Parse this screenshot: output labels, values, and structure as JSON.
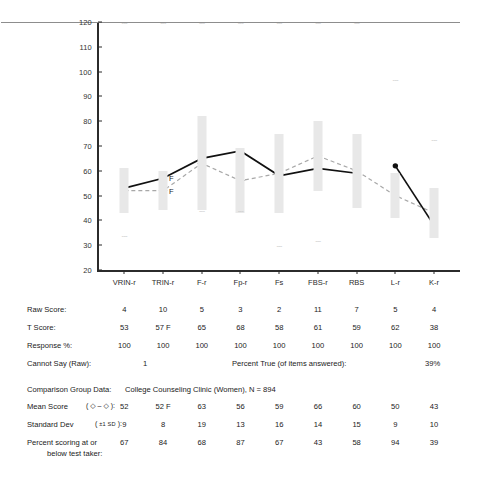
{
  "chart_data": {
    "type": "line",
    "title": "",
    "xlabel": "",
    "ylabel": "",
    "ylim": [
      20,
      120
    ],
    "yticks": [
      120,
      110,
      100,
      90,
      80,
      70,
      60,
      50,
      40,
      30,
      20
    ],
    "grid": false,
    "legend_position": "none",
    "reference_line": 50,
    "categories": [
      "VRIN-r",
      "TRIN-r",
      "F-r",
      "Fp-r",
      "Fs",
      "FBS-r",
      "RBS",
      "L-r",
      "K-r"
    ],
    "series": [
      {
        "name": "T Score",
        "style": "solid-black-filled-circle",
        "values": [
          53,
          57,
          65,
          68,
          58,
          61,
          59,
          62,
          38
        ],
        "segments": [
          [
            0,
            6
          ],
          [
            7,
            8
          ]
        ]
      },
      {
        "name": "Mean Score",
        "style": "dashed-gray-open-diamond",
        "values": [
          52,
          52,
          63,
          56,
          59,
          66,
          60,
          50,
          43
        ]
      }
    ],
    "sd_bars": {
      "name": "+/-1 SD band",
      "color": "#e8e8e8",
      "values": [
        9,
        8,
        19,
        13,
        16,
        14,
        15,
        9,
        10
      ]
    },
    "annotations": [
      {
        "text": "F",
        "category": "TRIN-r",
        "value": 57
      },
      {
        "text": "F",
        "category": "TRIN-r",
        "value": 52
      }
    ],
    "dash_markers": {
      "note": "faint '---' marks at +/-1SD extremes falling outside the plotted band",
      "top": [
        {
          "category": "VRIN-r",
          "value": 120
        },
        {
          "category": "TRIN-r",
          "value": 120
        },
        {
          "category": "F-r",
          "value": 120
        },
        {
          "category": "Fp-r",
          "value": 120
        },
        {
          "category": "Fs",
          "value": 120
        },
        {
          "category": "FBS-r",
          "value": 120
        },
        {
          "category": "RBS",
          "value": 120
        },
        {
          "category": "L-r",
          "value": 97
        }
      ],
      "bottom": [
        {
          "category": "VRIN-r",
          "value": 34
        },
        {
          "category": "F-r",
          "value": 44
        },
        {
          "category": "Fp-r",
          "value": 44
        },
        {
          "category": "Fs",
          "value": 30
        },
        {
          "category": "FBS-r",
          "value": 32
        },
        {
          "category": "K-r",
          "value": 73
        }
      ]
    }
  },
  "scores_table": {
    "columns": [
      "VRIN-r",
      "TRIN-r",
      "F-r",
      "Fp-r",
      "Fs",
      "FBS-r",
      "RBS",
      "L-r",
      "K-r"
    ],
    "rows": [
      {
        "label": "Raw Score:",
        "values": [
          "4",
          "10",
          "5",
          "3",
          "2",
          "11",
          "7",
          "5",
          "4"
        ]
      },
      {
        "label": "T Score:",
        "values": [
          "53",
          "57 F",
          "65",
          "68",
          "58",
          "61",
          "59",
          "62",
          "38"
        ]
      },
      {
        "label": "Response %:",
        "values": [
          "100",
          "100",
          "100",
          "100",
          "100",
          "100",
          "100",
          "100",
          "100"
        ]
      }
    ]
  },
  "cannot_say": {
    "label": "Cannot Say (Raw):",
    "value": "1"
  },
  "percent_true": {
    "label": "Percent True (of items answered):",
    "value": "39%"
  },
  "comparison_group": {
    "label": "Comparison Group Data:",
    "value": "College Counseling Clinic (Women), N = 894",
    "rows": [
      {
        "label": "Mean Score",
        "symbol": "( ◇ – ◇ ):",
        "values": [
          "52",
          "52 F",
          "63",
          "56",
          "59",
          "66",
          "60",
          "50",
          "43"
        ]
      },
      {
        "label": "Standard Dev",
        "symbol": "( ±1 SD ):",
        "values": [
          "9",
          "8",
          "19",
          "13",
          "16",
          "14",
          "15",
          "9",
          "10"
        ]
      },
      {
        "label": "Percent scoring at or",
        "label2": "below test taker:",
        "symbol": "",
        "values": [
          "67",
          "84",
          "68",
          "87",
          "67",
          "43",
          "58",
          "94",
          "39"
        ]
      }
    ]
  },
  "colors": {
    "axis": "#2b2b2b",
    "sd_band": "#e8e8e8",
    "mid_line": "#8d8d8d",
    "t_score_line": "#111111",
    "mean_line": "#a8a8a8",
    "dash_marker": "#c9c9c9",
    "text": "#1a1a1a"
  }
}
